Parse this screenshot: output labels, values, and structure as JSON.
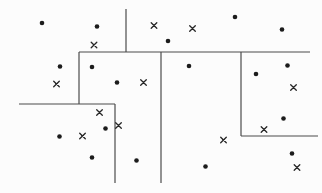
{
  "figure": {
    "width": 322,
    "height": 193,
    "background": "#fcfcfc",
    "line_color": "#4b4b4b",
    "line_width": 1.2,
    "dot_color": "#1c1c1c",
    "cross_color": "#262626",
    "dot_radius": 2.3,
    "cross_half_size": 2.8,
    "cross_stroke_width": 1.3,
    "lines": [
      {
        "x1": 126,
        "y1": 9,
        "x2": 126,
        "y2": 52
      },
      {
        "x1": 79,
        "y1": 52,
        "x2": 310,
        "y2": 52
      },
      {
        "x1": 79,
        "y1": 52,
        "x2": 79,
        "y2": 104
      },
      {
        "x1": 19,
        "y1": 104,
        "x2": 115,
        "y2": 104
      },
      {
        "x1": 115,
        "y1": 104,
        "x2": 115,
        "y2": 183
      },
      {
        "x1": 161,
        "y1": 52,
        "x2": 161,
        "y2": 183
      },
      {
        "x1": 241,
        "y1": 52,
        "x2": 241,
        "y2": 136
      },
      {
        "x1": 241,
        "y1": 136,
        "x2": 318,
        "y2": 136
      }
    ],
    "points": [
      {
        "x": 42,
        "y": 23,
        "type": "dot"
      },
      {
        "x": 97,
        "y": 26.5,
        "type": "dot"
      },
      {
        "x": 94,
        "y": 45,
        "type": "cross"
      },
      {
        "x": 154,
        "y": 25.5,
        "type": "cross"
      },
      {
        "x": 168,
        "y": 41,
        "type": "dot"
      },
      {
        "x": 192.5,
        "y": 28.5,
        "type": "cross"
      },
      {
        "x": 235,
        "y": 17,
        "type": "dot"
      },
      {
        "x": 282,
        "y": 29.5,
        "type": "dot"
      },
      {
        "x": 60,
        "y": 66.5,
        "type": "dot"
      },
      {
        "x": 56.5,
        "y": 84,
        "type": "cross"
      },
      {
        "x": 92,
        "y": 67,
        "type": "dot"
      },
      {
        "x": 117,
        "y": 82.5,
        "type": "dot"
      },
      {
        "x": 143.5,
        "y": 82.5,
        "type": "cross"
      },
      {
        "x": 99.5,
        "y": 112.5,
        "type": "cross"
      },
      {
        "x": 105.5,
        "y": 128.5,
        "type": "dot"
      },
      {
        "x": 59.5,
        "y": 136.5,
        "type": "dot"
      },
      {
        "x": 82.5,
        "y": 136,
        "type": "cross"
      },
      {
        "x": 92,
        "y": 157.5,
        "type": "dot"
      },
      {
        "x": 118.5,
        "y": 125.5,
        "type": "cross"
      },
      {
        "x": 136.5,
        "y": 160.5,
        "type": "dot"
      },
      {
        "x": 189,
        "y": 66,
        "type": "dot"
      },
      {
        "x": 223.5,
        "y": 140,
        "type": "cross"
      },
      {
        "x": 205.5,
        "y": 166.5,
        "type": "dot"
      },
      {
        "x": 256,
        "y": 74,
        "type": "dot"
      },
      {
        "x": 287.5,
        "y": 65.5,
        "type": "dot"
      },
      {
        "x": 293.5,
        "y": 87.5,
        "type": "cross"
      },
      {
        "x": 283.5,
        "y": 118.5,
        "type": "dot"
      },
      {
        "x": 264,
        "y": 129.5,
        "type": "cross"
      },
      {
        "x": 292,
        "y": 153.5,
        "type": "dot"
      },
      {
        "x": 297,
        "y": 167.5,
        "type": "cross"
      }
    ]
  }
}
